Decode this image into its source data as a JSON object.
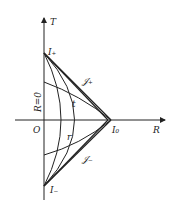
{
  "diagram": {
    "axes": {
      "vertical": "T",
      "horizontal": "R",
      "origin": "O"
    },
    "labels": {
      "i_plus": "I₊",
      "i_minus": "I₋",
      "i_zero": "I₀",
      "scri_plus": "𝒥₊",
      "scri_minus": "𝒥₋",
      "t_curve": "t",
      "r_curve": "r",
      "r_zero": "R=0"
    },
    "colors": {
      "line": "#222222",
      "background": "#ffffff"
    }
  }
}
